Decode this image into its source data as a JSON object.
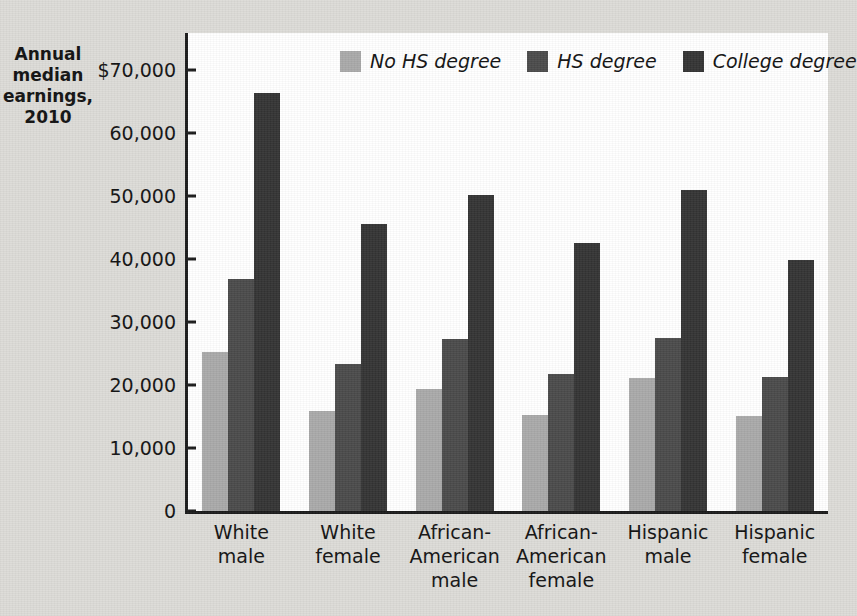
{
  "chart_data": {
    "type": "bar",
    "title": "",
    "ylabel": "Annual median earnings, 2010",
    "xlabel": "",
    "ylim": [
      0,
      70000
    ],
    "ytick_labels": [
      "$70,000",
      "60,000",
      "50,000",
      "40,000",
      "30,000",
      "20,000",
      "10,000",
      "0"
    ],
    "ytick_values": [
      70000,
      60000,
      50000,
      40000,
      30000,
      20000,
      10000,
      0
    ],
    "grid": false,
    "legend_position": "top-center",
    "categories": [
      "White male",
      "White female",
      "African-American male",
      "African-American female",
      "Hispanic male",
      "Hispanic female"
    ],
    "category_lines": [
      [
        "White",
        "male"
      ],
      [
        "White",
        "female"
      ],
      [
        "African-",
        "American",
        "male"
      ],
      [
        "African-",
        "American",
        "female"
      ],
      [
        "Hispanic",
        "male"
      ],
      [
        "Hispanic",
        "female"
      ]
    ],
    "series": [
      {
        "name": "No HS degree",
        "color": "#a9a9a9",
        "values": [
          25300,
          15800,
          19300,
          15200,
          21100,
          15100
        ]
      },
      {
        "name": "HS degree",
        "color": "#4a4a4a",
        "values": [
          36800,
          23300,
          27300,
          21700,
          27400,
          21200
        ]
      },
      {
        "name": "College degree",
        "color": "#333333",
        "values": [
          66400,
          45600,
          50200,
          42500,
          50900,
          39900
        ]
      }
    ]
  },
  "axis_title_lines": [
    "Annual",
    "median",
    "earnings,",
    "2010"
  ],
  "colors": {
    "page_background": "#dcdbd7",
    "plot_background": "#ffffff",
    "axis": "#1a1a1a",
    "text": "#111111"
  }
}
